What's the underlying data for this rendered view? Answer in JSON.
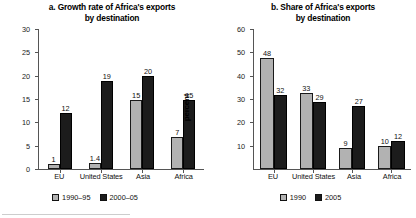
{
  "figure": {
    "panels": [
      {
        "id": "panel-a",
        "title": "a. Growth rate of Africa's exports\nby destination",
        "title_line1": "a. Growth rate of Africa's exports",
        "title_line2": "by destination",
        "ylabel": "percent"
      },
      {
        "id": "panel-b",
        "title": "b. Share of Africa's exports\nby destination",
        "title_line1": "b. Share of Africa's exports",
        "title_line2": "by destination",
        "ylabel": "percent"
      }
    ]
  },
  "colors": {
    "series0": "#b2b2b2",
    "series1": "#1c1c1c",
    "axis": "#555555",
    "text": "#111111",
    "background": "#ffffff"
  },
  "chart_data": [
    {
      "type": "bar",
      "title": "a. Growth rate of Africa's exports by destination",
      "xlabel": "",
      "ylabel": "percent",
      "categories": [
        "EU",
        "United States",
        "Asia",
        "Africa"
      ],
      "series": [
        {
          "name": "1990–95",
          "color": "#b2b2b2",
          "values": [
            1,
            1.4,
            15,
            7
          ],
          "labels": [
            "1",
            "1.4",
            "15",
            "7"
          ]
        },
        {
          "name": "2000–05",
          "color": "#1c1c1c",
          "values": [
            12,
            19,
            20,
            15
          ],
          "labels": [
            "12",
            "19",
            "20",
            "15"
          ]
        }
      ],
      "ylim": [
        0,
        30
      ],
      "yticks": [
        0,
        5,
        10,
        15,
        20,
        25,
        30
      ],
      "ytick_labels": [
        "0",
        "5",
        "10",
        "15",
        "20",
        "25",
        "30"
      ],
      "grid": false,
      "legend_position": "bottom",
      "data_labels": true
    },
    {
      "type": "bar",
      "title": "b. Share of Africa's exports by destination",
      "xlabel": "",
      "ylabel": "percent",
      "categories": [
        "EU",
        "United States",
        "Asia",
        "Africa"
      ],
      "series": [
        {
          "name": "1990",
          "color": "#b2b2b2",
          "values": [
            48,
            33,
            9,
            10
          ],
          "labels": [
            "48",
            "33",
            "9",
            "10"
          ]
        },
        {
          "name": "2005",
          "color": "#1c1c1c",
          "values": [
            32,
            29,
            27,
            12
          ],
          "labels": [
            "32",
            "29",
            "27",
            "12"
          ]
        }
      ],
      "ylim": [
        0,
        60
      ],
      "yticks": [
        10,
        20,
        30,
        40,
        50,
        60
      ],
      "ytick_labels": [
        "10",
        "20",
        "30",
        "40",
        "50",
        "60"
      ],
      "grid": false,
      "legend_position": "bottom",
      "data_labels": true
    }
  ]
}
